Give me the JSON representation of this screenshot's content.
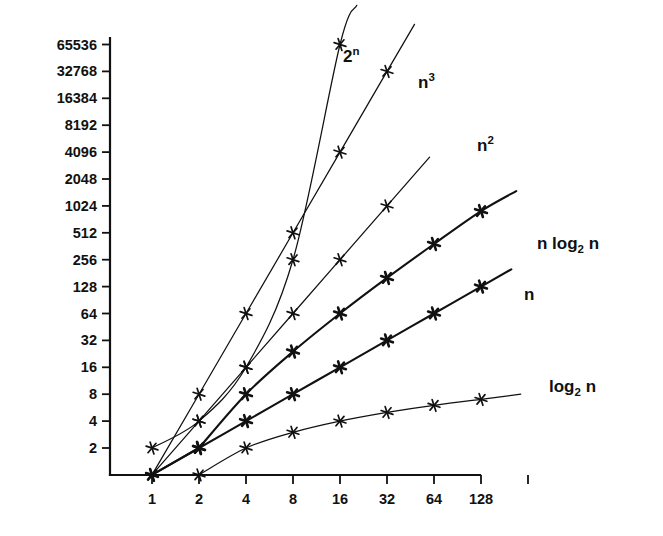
{
  "chart_data": {
    "type": "line",
    "title": "",
    "subtitle": "",
    "xlabel": "",
    "ylabel": "",
    "xscale": "log2",
    "yscale": "log2",
    "grid": false,
    "legend": "inline-right-of-curve",
    "x_tick_labels": [
      "1",
      "2",
      "4",
      "8",
      "16",
      "32",
      "64",
      "128"
    ],
    "x_tick_values": [
      1,
      2,
      4,
      8,
      16,
      32,
      64,
      128
    ],
    "y_tick_labels": [
      "2",
      "4",
      "8",
      "16",
      "32",
      "64",
      "128",
      "256",
      "512",
      "1024",
      "2048",
      "4096",
      "8192",
      "16384",
      "32768",
      "65536"
    ],
    "y_tick_values": [
      2,
      4,
      8,
      16,
      32,
      64,
      128,
      256,
      512,
      1024,
      2048,
      4096,
      8192,
      16384,
      32768,
      65536
    ],
    "xlim": [
      1,
      256
    ],
    "ylim": [
      1,
      65536
    ],
    "series": [
      {
        "name": "2^n",
        "label": "2",
        "label_sup": "n",
        "marker": "star",
        "x": [
          1,
          2,
          4,
          8,
          16
        ],
        "values": [
          2,
          4,
          16,
          256,
          65536
        ]
      },
      {
        "name": "n^3",
        "label": "n",
        "label_sup": "3",
        "marker": "star",
        "x": [
          2,
          4,
          8,
          16,
          32
        ],
        "values": [
          8,
          64,
          512,
          4096,
          32768
        ]
      },
      {
        "name": "n^2",
        "label": "n",
        "label_sup": "2",
        "marker": "star",
        "x": [
          1,
          2,
          4,
          8,
          16,
          32
        ],
        "values": [
          1,
          4,
          16,
          64,
          256,
          1024
        ]
      },
      {
        "name": "n log2 n",
        "label": "n log",
        "label_sub": "2",
        "label_tail": "n",
        "marker": "star",
        "x": [
          2,
          4,
          8,
          16,
          32,
          64,
          128
        ],
        "values": [
          2,
          8,
          24,
          64,
          160,
          384,
          896
        ]
      },
      {
        "name": "n",
        "label": "n",
        "marker": "star",
        "x": [
          1,
          2,
          4,
          8,
          16,
          32,
          64,
          128
        ],
        "values": [
          1,
          2,
          4,
          8,
          16,
          32,
          64,
          128
        ]
      },
      {
        "name": "log2 n",
        "label": "log",
        "label_sub": "2",
        "label_tail": "n",
        "marker": "star",
        "x": [
          2,
          4,
          8,
          16,
          32,
          64,
          128
        ],
        "values": [
          1,
          2,
          3,
          4,
          5,
          6,
          7
        ]
      }
    ]
  },
  "axes": {
    "y_axis_name": "y-axis",
    "x_axis_name": "x-axis"
  },
  "colors": {
    "background": "#ffffff",
    "ink": "#111111"
  }
}
